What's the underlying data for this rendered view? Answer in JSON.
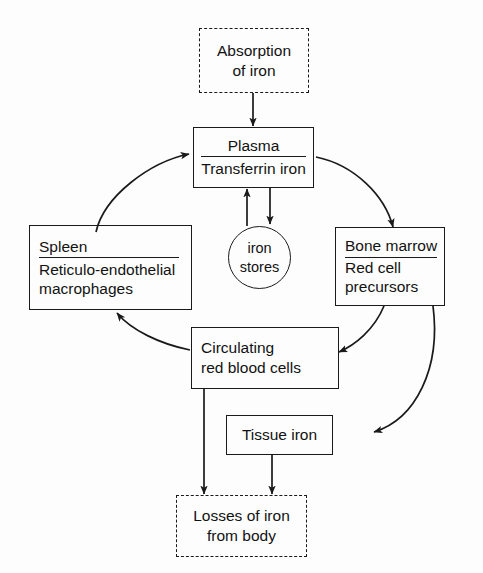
{
  "diagram": {
    "colors": {
      "stroke": "#1a1a1a",
      "text": "#121212",
      "background": "#fdfdfd"
    },
    "nodes": {
      "absorption": {
        "name": "absorption-of-iron",
        "shape": "dashed-rect",
        "lines": [
          "Absorption",
          "of iron"
        ]
      },
      "plasma": {
        "name": "plasma-transferrin-iron",
        "shape": "rect",
        "lines": [
          "Plasma",
          "Transferrin iron"
        ]
      },
      "spleen": {
        "name": "spleen-reticulo-endothelial-macrophages",
        "shape": "rect",
        "lines": [
          "Spleen",
          "Reticulo-endothelial",
          "macrophages"
        ]
      },
      "iron_stores": {
        "name": "iron-stores",
        "shape": "ellipse",
        "lines": [
          "iron",
          "stores"
        ]
      },
      "bone_marrow": {
        "name": "bone-marrow-red-cell-precursors",
        "shape": "rect",
        "lines": [
          "Bone marrow",
          "Red cell",
          "precursors"
        ]
      },
      "circulating_rbc": {
        "name": "circulating-red-blood-cells",
        "shape": "rect",
        "lines": [
          "Circulating",
          "red blood cells"
        ]
      },
      "tissue_iron": {
        "name": "tissue-iron",
        "shape": "rect",
        "lines": [
          "Tissue iron"
        ]
      },
      "losses": {
        "name": "losses-of-iron-from-body",
        "shape": "dashed-rect",
        "lines": [
          "Losses of iron",
          "from body"
        ]
      }
    },
    "edges": [
      {
        "from": "absorption",
        "to": "plasma",
        "style": "straight-down"
      },
      {
        "from": "spleen",
        "to": "plasma",
        "style": "curve-up-right"
      },
      {
        "from": "plasma",
        "to": "bone_marrow",
        "style": "curve-down-right"
      },
      {
        "from": "plasma",
        "to": "iron_stores",
        "style": "straight-down"
      },
      {
        "from": "iron_stores",
        "to": "plasma",
        "style": "straight-up"
      },
      {
        "from": "bone_marrow",
        "to": "circulating_rbc",
        "style": "curve-down-left"
      },
      {
        "from": "bone_marrow",
        "to": "tissue_iron",
        "style": "curve-down-left-long"
      },
      {
        "from": "circulating_rbc",
        "to": "spleen",
        "style": "curve-up-left"
      },
      {
        "from": "circulating_rbc",
        "to": "losses",
        "style": "straight-down"
      },
      {
        "from": "tissue_iron",
        "to": "losses",
        "style": "straight-down"
      }
    ]
  }
}
